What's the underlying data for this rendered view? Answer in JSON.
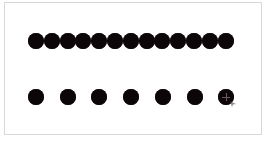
{
  "canvas": {
    "background": "#ffffff",
    "frame_border_color": "#d8d8d8"
  },
  "rows": [
    {
      "name": "top-row",
      "count": 13,
      "y_center": 41,
      "x_start": 36,
      "spacing": 15.8,
      "diameter": 16,
      "color": "#0c0608",
      "touching": true
    },
    {
      "name": "bottom-row",
      "count": 7,
      "y_center": 97,
      "x_start": 36,
      "spacing": 31.7,
      "diameter": 16,
      "color": "#0c0608",
      "touching": false
    }
  ],
  "cursor": {
    "icon": "crosshair-cursor-icon",
    "on_row": 1,
    "on_dot_index": 6,
    "color": "#6b5b60"
  }
}
